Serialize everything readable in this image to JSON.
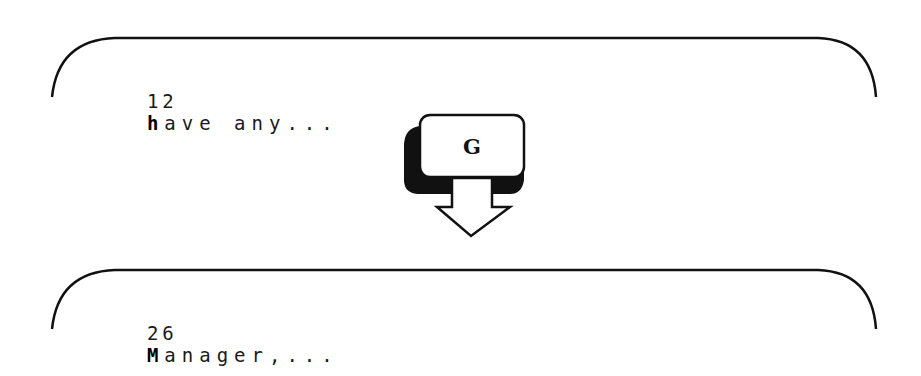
{
  "screens": [
    {
      "line_number": "12",
      "cursor_char": "h",
      "rest": "ave any..."
    },
    {
      "line_number": "26",
      "cursor_char": "M",
      "rest": "anager,..."
    }
  ],
  "command_key": {
    "label": "G",
    "icon": "down-arrow-icon"
  },
  "colors": {
    "ink": "#111111",
    "background": "#ffffff"
  }
}
